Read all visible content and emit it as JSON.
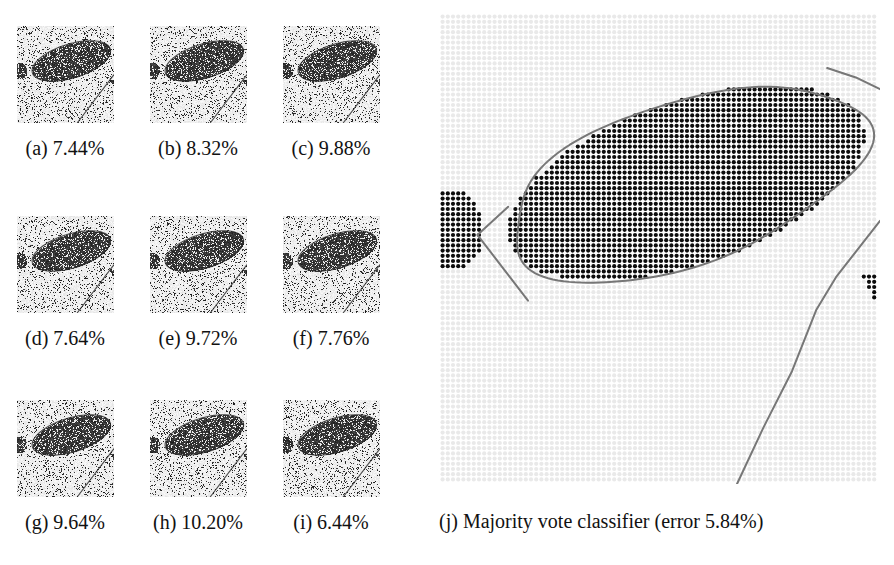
{
  "figure": {
    "kind": "segmentation-figure",
    "panel_count": 10
  },
  "thumbnails": [
    {
      "id": "a",
      "caption": "(a) 7.44%",
      "label": "(a)",
      "error": "7.44%",
      "seed": 11
    },
    {
      "id": "b",
      "caption": "(b) 8.32%",
      "label": "(b)",
      "error": "8.32%",
      "seed": 22
    },
    {
      "id": "c",
      "caption": "(c) 9.88%",
      "label": "(c)",
      "error": "9.88%",
      "seed": 33
    },
    {
      "id": "d",
      "caption": "(d) 7.64%",
      "label": "(d)",
      "error": "7.64%",
      "seed": 44
    },
    {
      "id": "e",
      "caption": "(e) 9.72%",
      "label": "(e)",
      "error": "9.72%",
      "seed": 55
    },
    {
      "id": "f",
      "caption": "(f) 7.76%",
      "label": "(f)",
      "error": "7.76%",
      "seed": 66
    },
    {
      "id": "g",
      "caption": "(g) 9.64%",
      "label": "(g)",
      "error": "9.64%",
      "seed": 77
    },
    {
      "id": "h",
      "caption": "(h) 10.20%",
      "label": "(h)",
      "error": "10.20%",
      "seed": 88
    },
    {
      "id": "i",
      "caption": "(i) 6.44%",
      "label": "(i)",
      "error": "6.44%",
      "seed": 99
    }
  ],
  "majority_panel": {
    "caption": "(j) Majority vote classifier (error 5.84%)",
    "label": "(j)",
    "title": "Majority vote classifier",
    "error": "5.84%",
    "dot_pitch_px": 5.2,
    "dot_radius_px": 2.1,
    "foreground_color": "#0d0d0d",
    "background_dot_color": "#e9e9e9",
    "contour_color": "#777777",
    "contour_width_px": 2
  },
  "chart_data": {
    "type": "table",
    "categories": [
      "(a)",
      "(b)",
      "(c)",
      "(d)",
      "(e)",
      "(f)",
      "(g)",
      "(h)",
      "(i)",
      "(j)"
    ],
    "values": [
      7.44,
      8.32,
      9.88,
      7.64,
      9.72,
      7.76,
      9.64,
      10.2,
      6.44,
      5.84
    ],
    "xlabel": "classifier",
    "ylabel": "error (%)",
    "ylim": [
      0,
      11
    ],
    "annotations": [
      "(j) is the majority vote classifier and has the lowest error"
    ]
  }
}
